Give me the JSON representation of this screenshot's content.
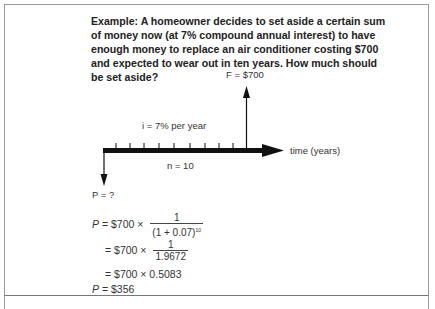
{
  "question": "Example: A homeowner decides to set aside a certain sum of money now (at 7% compound annual interest) to have enough money to replace an air conditioner costing $700 and expected to wear out in ten years. How much should be set aside?",
  "diagram": {
    "future_label": "F = $700",
    "interest_label": "i = 7% per year",
    "periods_label": "n = 10",
    "time_axis_label": "time  (years)",
    "present_label": "P = ?",
    "tick_count": 10
  },
  "solution": {
    "line1": {
      "lhs": "P",
      "eq": "= $700 ×",
      "num": "1",
      "den_base": "(1 + 0.07)",
      "den_exp": "10"
    },
    "line2": {
      "eq": "= $700 ×",
      "num": "1",
      "den": "1.9672"
    },
    "line3": {
      "eq": "= $700 × 0.5083"
    },
    "line4": {
      "lhs": "P",
      "eq": "= $356"
    }
  }
}
